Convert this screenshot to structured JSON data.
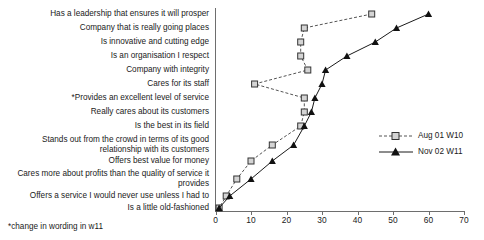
{
  "chart_data": {
    "type": "line",
    "title": "",
    "xlabel": "",
    "ylabel": "",
    "xlim": [
      0,
      70
    ],
    "xticks": [
      0,
      10,
      20,
      30,
      40,
      50,
      60,
      70
    ],
    "xtick_labels": [
      "0",
      "10",
      "20",
      "30",
      "40",
      "50",
      "60",
      "70"
    ],
    "grid": false,
    "orientation": "horizontal",
    "legend_position": "center-right",
    "footnote": "*change in wording in w11",
    "categories": [
      "Has a leadership that ensures it will prosper",
      "Company that is really going places",
      "Is innovative and cutting edge",
      "Is an organisation I respect",
      "Company with integrity",
      "Cares for its staff",
      "*Provides an excellent level of service",
      "Really cares about its customers",
      "Is the best in its field",
      "Stands out from the crowd in terms of its good relationship with its customers",
      "Offers best value for money",
      "Cares more about profits than the quality of service it provides",
      "Offers a service I would never use unless I had to",
      "Is a little old-fashioned"
    ],
    "series": [
      {
        "name": "Aug 01 W10",
        "marker": "square",
        "line_style": "dashed",
        "color": "#555555",
        "values": [
          44,
          25,
          24,
          24,
          26,
          11,
          25,
          25,
          24,
          16,
          10,
          6,
          3,
          1
        ]
      },
      {
        "name": "Nov 02 W11",
        "marker": "triangle",
        "line_style": "solid",
        "color": "#1a1a1a",
        "values": [
          60,
          51,
          45,
          37,
          31,
          30,
          28,
          27,
          25,
          22,
          16,
          10,
          4,
          1
        ]
      }
    ]
  },
  "legend": {
    "items": [
      {
        "label": "Aug 01 W10"
      },
      {
        "label": "Nov 02 W11"
      }
    ]
  },
  "footnote": {
    "text": "*change in wording in w11"
  }
}
